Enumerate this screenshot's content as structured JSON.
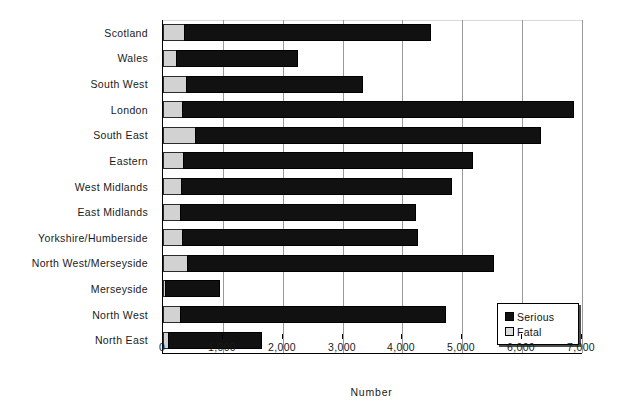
{
  "chart_data": {
    "type": "bar",
    "orientation": "horizontal",
    "stacked": true,
    "title": "",
    "xlabel": "Number",
    "ylabel": "",
    "xlim": [
      0,
      7000
    ],
    "xticks": [
      0,
      1000,
      2000,
      3000,
      4000,
      5000,
      6000,
      7000
    ],
    "xtick_labels": [
      "0",
      "1,000",
      "2,000",
      "3,000",
      "4,000",
      "5,000",
      "6,000",
      "7,000"
    ],
    "grid": true,
    "grid_axis": "x",
    "legend_position": "bottom-right",
    "categories": [
      "Scotland",
      "Wales",
      "South West",
      "London",
      "South East",
      "Eastern",
      "West Midlands",
      "East Midlands",
      "Yorkshire/Humberside",
      "North West/Merseyside",
      "Merseyside",
      "North West",
      "North East"
    ],
    "series": [
      {
        "name": "Fatal",
        "color": "#d2d2d2",
        "values": [
          370,
          234,
          400,
          334,
          550,
          350,
          318,
          300,
          334,
          420,
          35,
          300,
          100
        ]
      },
      {
        "name": "Serious",
        "color": "#111111",
        "values": [
          4107,
          2021,
          2941,
          6532,
          5765,
          4828,
          4510,
          3927,
          3926,
          5110,
          900,
          4428,
          1554
        ]
      }
    ],
    "totals": [
      4477,
      2255,
      3341,
      6866,
      6315,
      5178,
      4828,
      4227,
      4260,
      5530,
      935,
      4728,
      1654
    ]
  },
  "axis": {
    "x_title": "Number"
  },
  "legend": {
    "items": [
      {
        "label": "Serious",
        "color": "#111111"
      },
      {
        "label": "Fatal",
        "color": "#dcdcdc"
      }
    ]
  }
}
